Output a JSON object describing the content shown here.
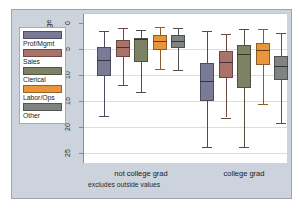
{
  "chart_data": {
    "type": "box",
    "title": "",
    "xlabel": "",
    "ylabel": "hourly wage",
    "ylim": [
      0,
      26
    ],
    "y_inverted": true,
    "yticks": [
      0,
      5,
      10,
      15,
      20,
      25
    ],
    "ytick_labels": [
      "0",
      "5",
      "10",
      "15",
      "20",
      "25"
    ],
    "grid": true,
    "legend_position": "left-outside",
    "note": "excludes outside values",
    "categories": [
      "not college grad",
      "college grad"
    ],
    "series": [
      {
        "name": "Prof/Mgmt",
        "color": "#7b7a96",
        "boxes": [
          {
            "category": "not college grad",
            "whisker_low": 1.6,
            "q1": 4.6,
            "median": 7.1,
            "q3": 10.3,
            "whisker_high": 18.0
          },
          {
            "category": "college grad",
            "whisker_low": 1.7,
            "q1": 7.7,
            "median": 11.2,
            "q3": 15.1,
            "whisker_high": 23.8
          }
        ]
      },
      {
        "name": "Sales",
        "color": "#a9736a",
        "boxes": [
          {
            "category": "not college grad",
            "whisker_low": 1.1,
            "q1": 3.4,
            "median": 4.6,
            "q3": 6.6,
            "whisker_high": 12.0
          },
          {
            "category": "college grad",
            "whisker_low": 2.2,
            "q1": 5.4,
            "median": 7.5,
            "q3": 10.7,
            "whisker_high": 18.2
          }
        ]
      },
      {
        "name": "Clerical",
        "color": "#7c8263",
        "boxes": [
          {
            "category": "not college grad",
            "whisker_low": 1.4,
            "q1": 3.0,
            "median": 3.1,
            "q3": 7.5,
            "whisker_high": 13.3
          },
          {
            "category": "college grad",
            "whisker_low": 1.2,
            "q1": 4.4,
            "median": 6.1,
            "q3": 12.6,
            "whisker_high": 23.9
          }
        ]
      },
      {
        "name": "Labor/Ops",
        "color": "#e8953c",
        "boxes": [
          {
            "category": "not college grad",
            "whisker_low": 0.9,
            "q1": 2.4,
            "median": 3.5,
            "q3": 5.2,
            "whisker_high": 9.0
          },
          {
            "category": "college grad",
            "whisker_low": 1.3,
            "q1": 4.0,
            "median": 5.3,
            "q3": 8.2,
            "whisker_high": 15.6
          }
        ]
      },
      {
        "name": "Other",
        "color": "#7f8482",
        "boxes": [
          {
            "category": "not college grad",
            "whisker_low": 1.0,
            "q1": 2.4,
            "median": 3.5,
            "q3": 4.8,
            "whisker_high": 9.1
          },
          {
            "category": "college grad",
            "whisker_low": 2.1,
            "q1": 6.4,
            "median": 8.3,
            "q3": 11.0,
            "whisker_high": 19.3
          }
        ]
      }
    ]
  },
  "legend": {
    "items": [
      {
        "label": "Prof/Mgmt",
        "color": "#7b7a96"
      },
      {
        "label": "Sales",
        "color": "#a9736a"
      },
      {
        "label": "Clerical",
        "color": "#7c8263"
      },
      {
        "label": "Labor/Ops",
        "color": "#e8953c"
      },
      {
        "label": "Other",
        "color": "#7f8482"
      }
    ]
  },
  "axes": {
    "y_title": "hourly wage",
    "y_tick_labels": [
      "0",
      "5",
      "10",
      "15",
      "20",
      "25"
    ],
    "x_group_labels": [
      "not college grad",
      "college grad"
    ]
  },
  "footnote": "excludes outside values"
}
